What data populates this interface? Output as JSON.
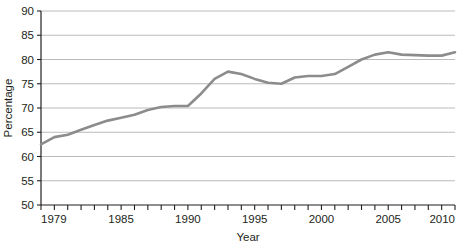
{
  "chart_data": {
    "type": "line",
    "title": "",
    "xlabel": "Year",
    "ylabel": "Percentage",
    "xlim": [
      1979,
      2010
    ],
    "ylim": [
      50,
      90
    ],
    "ytick_step": 5,
    "grid": true,
    "legend": "none",
    "line_color": "#8c8c8c",
    "axis_color": "#231f20",
    "grid_color": "#b3b3b3",
    "yticks": [
      50,
      55,
      60,
      65,
      70,
      75,
      80,
      85,
      90
    ],
    "ytick_labels": [
      "50",
      "55",
      "60",
      "65",
      "70",
      "75",
      "80",
      "85",
      "90"
    ],
    "xticks": [
      1979,
      1980,
      1981,
      1982,
      1983,
      1984,
      1985,
      1986,
      1987,
      1988,
      1989,
      1990,
      1991,
      1992,
      1993,
      1994,
      1995,
      1996,
      1997,
      1998,
      1999,
      2000,
      2001,
      2002,
      2003,
      2004,
      2005,
      2006,
      2007,
      2008,
      2009,
      2010
    ],
    "xtick_labels_shown": [
      "1979",
      "1985",
      "1990",
      "1995",
      "2000",
      "2005",
      "2010"
    ],
    "xtick_labels_shown_at": [
      1979,
      1985,
      1990,
      1995,
      2000,
      2005,
      2010
    ],
    "x": [
      1979,
      1980,
      1981,
      1982,
      1983,
      1984,
      1985,
      1986,
      1987,
      1988,
      1989,
      1990,
      1991,
      1992,
      1993,
      1994,
      1995,
      1996,
      1997,
      1998,
      1999,
      2000,
      2001,
      2002,
      2003,
      2004,
      2005,
      2006,
      2007,
      2008,
      2009,
      2010
    ],
    "values": [
      62.5,
      64.0,
      64.5,
      65.5,
      66.5,
      67.4,
      68.0,
      68.6,
      69.6,
      70.2,
      70.4,
      70.4,
      73.0,
      76.0,
      77.5,
      77.0,
      76.0,
      75.2,
      75.0,
      76.3,
      76.6,
      76.6,
      77.0,
      78.5,
      80.0,
      81.0,
      81.5,
      81.0,
      80.9,
      80.8,
      80.8,
      81.5
    ]
  }
}
